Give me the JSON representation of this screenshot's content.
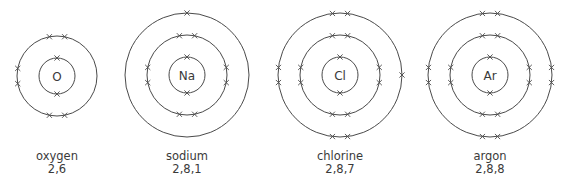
{
  "diagram": {
    "type": "electron-shell-diagrams",
    "atoms": [
      {
        "symbol": "O",
        "name": "oxygen",
        "configuration": "2,6",
        "center": [
          57,
          76
        ],
        "shells": [
          {
            "radius": 18,
            "electrons": 2,
            "angles": [
              -90,
              90
            ]
          },
          {
            "radius": 40,
            "electrons": 6,
            "angles": [
              -101,
              -79,
              169,
              191,
              79,
              101
            ]
          }
        ]
      },
      {
        "symbol": "Na",
        "name": "sodium",
        "configuration": "2,8,1",
        "center": [
          187,
          75
        ],
        "shells": [
          {
            "radius": 18,
            "electrons": 2,
            "angles": [
              -90,
              90
            ]
          },
          {
            "radius": 40,
            "electrons": 8,
            "angles": [
              -101,
              -79,
              169,
              191,
              79,
              101,
              -11,
              11
            ]
          },
          {
            "radius": 62,
            "electrons": 1,
            "angles": [
              -90
            ]
          }
        ]
      },
      {
        "symbol": "Cl",
        "name": "chlorine",
        "configuration": "2,8,7",
        "center": [
          340,
          75
        ],
        "shells": [
          {
            "radius": 18,
            "electrons": 2,
            "angles": [
              -90,
              90
            ]
          },
          {
            "radius": 40,
            "electrons": 8,
            "angles": [
              -101,
              -79,
              169,
              191,
              79,
              101,
              -11,
              11
            ]
          },
          {
            "radius": 62,
            "electrons": 7,
            "angles": [
              -97,
              -83,
              173,
              187,
              83,
              97,
              0
            ]
          }
        ]
      },
      {
        "symbol": "Ar",
        "name": "argon",
        "configuration": "2,8,8",
        "center": [
          490,
          75
        ],
        "shells": [
          {
            "radius": 18,
            "electrons": 2,
            "angles": [
              -90,
              90
            ]
          },
          {
            "radius": 40,
            "electrons": 8,
            "angles": [
              -101,
              -79,
              169,
              191,
              79,
              101,
              -11,
              11
            ]
          },
          {
            "radius": 62,
            "electrons": 8,
            "angles": [
              -97,
              -83,
              173,
              187,
              83,
              97,
              -7,
              7
            ]
          }
        ]
      }
    ],
    "colors": {
      "line": "#4a4a4a",
      "text": "#3a3a3a",
      "background": "#ffffff"
    }
  }
}
